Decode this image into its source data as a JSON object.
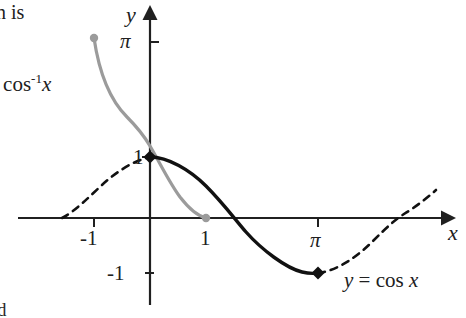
{
  "figure": {
    "kind": "math-graph",
    "background_color": "#ffffff",
    "ink_color": "#202020",
    "accent_gray": "#9b9b9b"
  },
  "page_text": {
    "top_fragment": "n is",
    "bottom_fragment": "d"
  },
  "axes": {
    "x_axis_label": "x",
    "y_axis_label": "y",
    "origin_px": [
      150,
      218
    ],
    "x_unit_px": 56,
    "y_unit_px": 61,
    "x_ticks": [
      {
        "value": -1,
        "label": "-1",
        "px": 94
      },
      {
        "value": 1,
        "label": "1",
        "px": 206
      },
      {
        "value": 3.14159,
        "label": "π",
        "px": 318
      }
    ],
    "y_ticks": [
      {
        "value": 3.14159,
        "label": "π",
        "px": 42
      },
      {
        "value": 1,
        "label": "1",
        "px": 157
      },
      {
        "value": -1,
        "label": "-1",
        "px": 273
      }
    ],
    "x_range": [
      -1.5,
      5.4
    ],
    "y_range": [
      -1.6,
      3.6
    ],
    "arrow_on_x_positive": true,
    "arrow_on_y_positive": true,
    "grid": false
  },
  "curves": [
    {
      "name": "arccos",
      "label_text": "= cos",
      "label_superscript": "-1",
      "label_variable": "x",
      "label_full": "y = cos⁻¹x",
      "color": "#9b9b9b",
      "style": "solid",
      "stroke_width": 3.2,
      "domain": [
        -1,
        1
      ],
      "endpoints": [
        {
          "x": -1,
          "y": 3.14159,
          "marker": "dot",
          "marker_color": "#9b9b9b"
        },
        {
          "x": 1,
          "y": 0,
          "marker": "dot",
          "marker_color": "#9b9b9b"
        }
      ],
      "sample_points": [
        {
          "x": -1.0,
          "y": 3.1416
        },
        {
          "x": -0.9,
          "y": 2.6906
        },
        {
          "x": -0.75,
          "y": 2.4189
        },
        {
          "x": -0.5,
          "y": 2.0944
        },
        {
          "x": -0.25,
          "y": 1.8235
        },
        {
          "x": 0.0,
          "y": 1.5708
        },
        {
          "x": 0.25,
          "y": 1.3181
        },
        {
          "x": 0.5,
          "y": 1.0472
        },
        {
          "x": 0.75,
          "y": 0.7227
        },
        {
          "x": 0.9,
          "y": 0.451
        },
        {
          "x": 1.0,
          "y": 0.0
        }
      ]
    },
    {
      "name": "cosine-principal",
      "label_text": "y = cos x",
      "label_prefix": "y",
      "label_op": "= cos",
      "label_variable": "x",
      "color": "#111111",
      "style": "solid",
      "stroke_width": 3.4,
      "domain": [
        0,
        3.14159
      ],
      "endpoints": [
        {
          "x": 0,
          "y": 1,
          "marker": "diamond",
          "marker_color": "#111111"
        },
        {
          "x": 3.14159,
          "y": -1,
          "marker": "diamond",
          "marker_color": "#111111"
        }
      ],
      "sample_points": [
        {
          "x": 0.0,
          "y": 1.0
        },
        {
          "x": 0.3927,
          "y": 0.9239
        },
        {
          "x": 0.7854,
          "y": 0.7071
        },
        {
          "x": 1.1781,
          "y": 0.3827
        },
        {
          "x": 1.5708,
          "y": 0.0
        },
        {
          "x": 1.9635,
          "y": -0.3827
        },
        {
          "x": 2.3562,
          "y": -0.7071
        },
        {
          "x": 2.7489,
          "y": -0.9239
        },
        {
          "x": 3.1416,
          "y": -1.0
        }
      ]
    },
    {
      "name": "cosine-extension-left",
      "color": "#111111",
      "style": "dashed",
      "stroke_width": 2.6,
      "dash_pattern": "7 6",
      "domain": [
        -1.5708,
        0
      ],
      "sample_points": [
        {
          "x": -1.5708,
          "y": 0.0
        },
        {
          "x": -1.1781,
          "y": 0.3827
        },
        {
          "x": -0.7854,
          "y": 0.7071
        },
        {
          "x": -0.3927,
          "y": 0.9239
        },
        {
          "x": 0.0,
          "y": 1.0
        }
      ]
    },
    {
      "name": "cosine-extension-right",
      "color": "#111111",
      "style": "dashed",
      "stroke_width": 2.6,
      "dash_pattern": "7 6",
      "domain": [
        3.14159,
        5.2
      ],
      "sample_points": [
        {
          "x": 3.1416,
          "y": -1.0
        },
        {
          "x": 3.5343,
          "y": -0.9239
        },
        {
          "x": 3.927,
          "y": -0.7071
        },
        {
          "x": 4.3197,
          "y": -0.3827
        },
        {
          "x": 4.7124,
          "y": 0.0
        },
        {
          "x": 5.0,
          "y": 0.2837
        },
        {
          "x": 5.2,
          "y": 0.4685
        }
      ]
    }
  ]
}
